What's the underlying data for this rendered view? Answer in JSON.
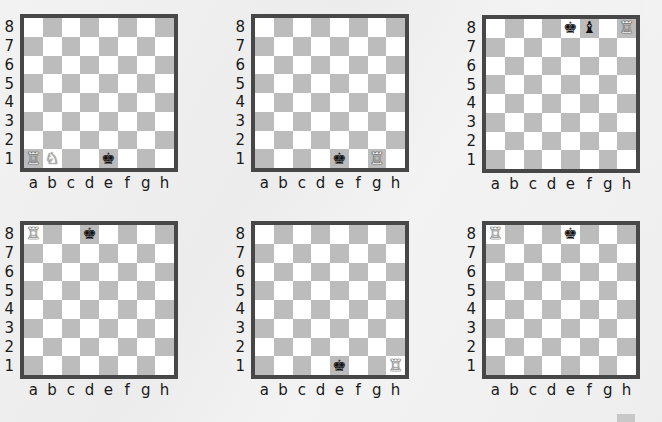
{
  "colors": {
    "light_square": "#ffffff",
    "dark_square": "#bcbcbc",
    "frame": "#474747",
    "background": "#efefef"
  },
  "files": [
    "a",
    "b",
    "c",
    "d",
    "e",
    "f",
    "g",
    "h"
  ],
  "ranks": [
    "8",
    "7",
    "6",
    "5",
    "4",
    "3",
    "2",
    "1"
  ],
  "diagrams": [
    {
      "id": 1,
      "pieces": [
        {
          "square": "a1",
          "color": "white",
          "type": "rook",
          "glyph": "♖"
        },
        {
          "square": "b1",
          "color": "white",
          "type": "knight",
          "glyph": "♘"
        },
        {
          "square": "e1",
          "color": "black",
          "type": "king",
          "glyph": "♚"
        }
      ]
    },
    {
      "id": 2,
      "pieces": [
        {
          "square": "e1",
          "color": "black",
          "type": "king",
          "glyph": "♚"
        },
        {
          "square": "g1",
          "color": "white",
          "type": "rook",
          "glyph": "♖"
        }
      ]
    },
    {
      "id": 3,
      "pieces": [
        {
          "square": "e8",
          "color": "black",
          "type": "king",
          "glyph": "♚"
        },
        {
          "square": "f8",
          "color": "black",
          "type": "bishop",
          "glyph": "♝"
        },
        {
          "square": "h8",
          "color": "white",
          "type": "rook",
          "glyph": "♖"
        }
      ]
    },
    {
      "id": 4,
      "pieces": [
        {
          "square": "a8",
          "color": "white",
          "type": "rook",
          "glyph": "♖"
        },
        {
          "square": "d8",
          "color": "black",
          "type": "king",
          "glyph": "♚"
        }
      ]
    },
    {
      "id": 5,
      "pieces": [
        {
          "square": "e1",
          "color": "black",
          "type": "king",
          "glyph": "♚"
        },
        {
          "square": "h1",
          "color": "white",
          "type": "rook",
          "glyph": "♖"
        }
      ]
    },
    {
      "id": 6,
      "pieces": [
        {
          "square": "a8",
          "color": "white",
          "type": "rook",
          "glyph": "♖"
        },
        {
          "square": "e8",
          "color": "black",
          "type": "king",
          "glyph": "♚"
        }
      ]
    }
  ],
  "layout_positions": [
    {
      "left": 0,
      "top": 14
    },
    {
      "left": 231,
      "top": 14
    },
    {
      "left": 462,
      "top": 15
    },
    {
      "left": 0,
      "top": 221
    },
    {
      "left": 231,
      "top": 221
    },
    {
      "left": 462,
      "top": 221
    }
  ]
}
